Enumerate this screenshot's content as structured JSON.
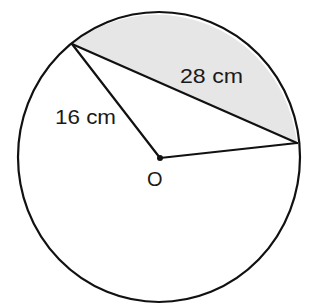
{
  "diagram": {
    "type": "circle-segment",
    "colors": {
      "stroke": "#111111",
      "shade": "#e6e6e6",
      "background": "#ffffff"
    },
    "circle": {
      "cx": 159,
      "cy": 157,
      "rx": 141,
      "ry": 145
    },
    "center_point": {
      "x": 160,
      "y": 158,
      "label": "O"
    },
    "points": {
      "A": {
        "x": 72,
        "y": 44
      },
      "B": {
        "x": 297,
        "y": 143
      }
    },
    "labels": {
      "radius": "16 cm",
      "chord": "28 cm",
      "center": "O"
    },
    "shaded_region": "minor segment between chord AB and arc"
  }
}
